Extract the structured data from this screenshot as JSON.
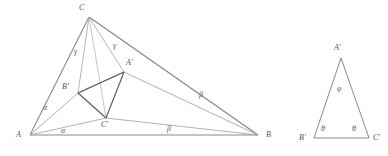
{
  "figure": {
    "type": "geometric-diagram",
    "background_color": "#ffffff",
    "outer_line_color": "#8d8d8d",
    "inner_line_color": "#6b6b6b",
    "cevian_line_color": "#a0a0a0",
    "label_color": "#5a5a5a",
    "width": 388,
    "height": 156
  },
  "main_triangle": {
    "name": "triangle-ABC",
    "vertices": [
      {
        "name": "A",
        "label": "A",
        "x": 30,
        "y": 135,
        "label_x": 16,
        "label_y": 131
      },
      {
        "name": "B",
        "label": "B",
        "x": 258,
        "y": 135,
        "label_x": 266,
        "label_y": 131
      },
      {
        "name": "C",
        "label": "C",
        "x": 89,
        "y": 17,
        "label_x": 79,
        "label_y": 4
      }
    ],
    "inner_vertices": [
      {
        "name": "A-prime",
        "label": "A'",
        "x": 124,
        "y": 72,
        "label_x": 126,
        "label_y": 59
      },
      {
        "name": "B-prime",
        "label": "B'",
        "x": 78,
        "y": 93,
        "label_x": 62,
        "label_y": 83
      },
      {
        "name": "C-prime",
        "label": "C'",
        "x": 106,
        "y": 118,
        "label_x": 101,
        "label_y": 121
      }
    ],
    "angle_labels": [
      {
        "name": "alpha-upper",
        "label": "α",
        "x": 43,
        "y": 104
      },
      {
        "name": "alpha-lower",
        "label": "α",
        "x": 61,
        "y": 128
      },
      {
        "name": "beta-upper",
        "label": "β",
        "x": 199,
        "y": 92
      },
      {
        "name": "beta-lower",
        "label": "β",
        "x": 167,
        "y": 126
      },
      {
        "name": "gamma-left",
        "label": "γ",
        "x": 74,
        "y": 49
      },
      {
        "name": "gamma-right",
        "label": "γ",
        "x": 113,
        "y": 43
      }
    ]
  },
  "secondary_triangle": {
    "name": "triangle-A-prime-B-prime-C-prime",
    "vertices": [
      {
        "name": "A-prime",
        "label": "A'",
        "x": 341,
        "y": 58,
        "label_x": 334,
        "label_y": 44
      },
      {
        "name": "B-prime",
        "label": "B'",
        "x": 314,
        "y": 138,
        "label_x": 299,
        "label_y": 134
      },
      {
        "name": "C-prime",
        "label": "C'",
        "x": 369,
        "y": 138,
        "label_x": 373,
        "label_y": 134
      }
    ],
    "angle_labels": [
      {
        "name": "phi-apex",
        "label": "φ",
        "x": 337,
        "y": 86
      },
      {
        "name": "theta-left",
        "label": "θ",
        "x": 321,
        "y": 126
      },
      {
        "name": "theta-right",
        "label": "θ",
        "x": 352,
        "y": 126
      }
    ]
  }
}
